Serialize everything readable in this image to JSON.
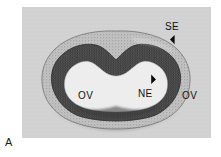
{
  "figure": {
    "panel_letter": "A",
    "page_background": "#ffffff",
    "plate_background": "#d2d2d2",
    "plate": {
      "x": 22,
      "y": 7,
      "width": 189,
      "height": 131
    }
  },
  "labels": {
    "se": {
      "text": "SE",
      "meaning": "surface ectoderm",
      "marker": "arrowhead-down-left"
    },
    "ne": {
      "text": "NE",
      "meaning": "neuroepithelium",
      "marker": "arrowhead-up-right"
    },
    "ov_left": {
      "text": "OV",
      "meaning": "optic vesicle"
    },
    "ov_right": {
      "text": "OV",
      "meaning": "optic vesicle"
    }
  },
  "specimen": {
    "description": "transverse section of embryo head showing folded neural plate",
    "tissue_layers": [
      {
        "name": "surface-ectoderm",
        "tone": "#b0b0b0",
        "stipple": "light"
      },
      {
        "name": "neuroepithelium",
        "tone": "#4a4a4a",
        "stipple": "dense"
      },
      {
        "name": "lumen",
        "tone": "#ececec",
        "stipple": "none"
      }
    ]
  },
  "colors": {
    "label_text": "#111111",
    "arrowhead": "#0b0b0b",
    "outer_layer": "#b6b6b6",
    "inner_layer": "#4d4d4d",
    "lumen": "#eeeeee"
  }
}
